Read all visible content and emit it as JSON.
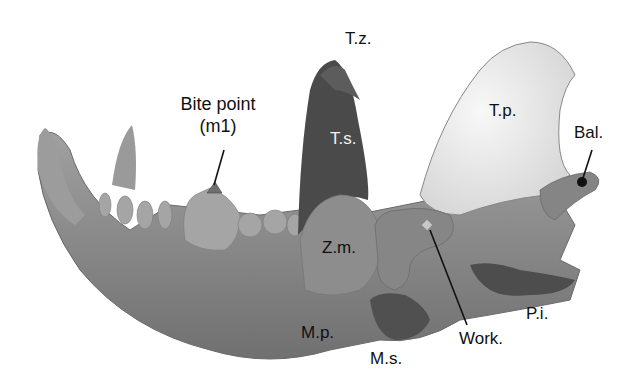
{
  "figure": {
    "colors": {
      "bone": "#8a8a8a",
      "bone_light": "#b3b3b3",
      "temporalis_superficial": "#4a4a4a",
      "temporalis_profundus": "#ececec",
      "zygomaticomandibularis": "#8e8e8e",
      "masseter_superficial": "#505050",
      "pterygoideus_internus": "#4d4d4d",
      "marker": "#111111",
      "work_marker": "#c8c8c8"
    }
  },
  "labels": {
    "bite_point_line1": "Bite point",
    "bite_point_line2": "(m1)",
    "tz": "T.z.",
    "ts": "T.s.",
    "tp": "T.p.",
    "bal": "Bal.",
    "zm": "Z.m.",
    "mp": "M.p.",
    "ms": "M.s.",
    "work": "Work.",
    "pi": "P.i."
  }
}
